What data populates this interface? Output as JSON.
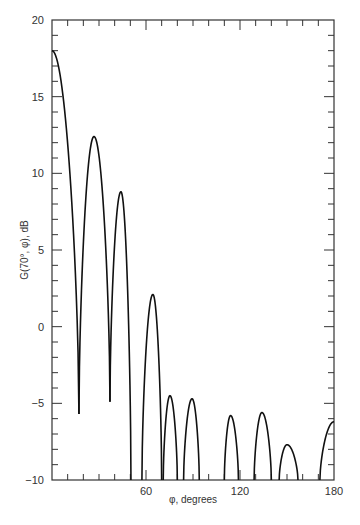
{
  "chart_data": {
    "type": "line",
    "title": "",
    "xlabel": "φ, degrees",
    "ylabel": "G(70°, φ), dB",
    "xlim": [
      0,
      180
    ],
    "ylim": [
      -10,
      20
    ],
    "grid": false,
    "legend": null,
    "x_major_ticks": [
      60,
      120,
      180
    ],
    "x_minor_step": 10,
    "y_major_ticks": [
      -10,
      -5,
      0,
      5,
      10,
      15,
      20
    ],
    "y_minor_step": 1,
    "x_tick_labels": [
      "60",
      "120",
      "180"
    ],
    "y_tick_labels": [
      "−10",
      "−5",
      "0",
      "5",
      "10",
      "15",
      "20"
    ],
    "series": [
      {
        "name": "G(70°, φ)",
        "lobes": [
          {
            "start": [
              0,
              18.0
            ],
            "peak": [
              0,
              18.0
            ],
            "end": [
              17.2,
              -5.7
            ]
          },
          {
            "start": [
              17.2,
              -5.7
            ],
            "peak": [
              26.8,
              12.4
            ],
            "end": [
              37.0,
              -4.9
            ]
          },
          {
            "start": [
              37.0,
              -4.9
            ],
            "peak": [
              44.0,
              8.8
            ],
            "end": [
              50.4,
              -10
            ]
          },
          {
            "start": [
              57.4,
              -10
            ],
            "peak": [
              64.4,
              2.1
            ],
            "end": [
              70.0,
              -10
            ]
          },
          {
            "start": [
              71.0,
              -10
            ],
            "peak": [
              75.3,
              -4.5
            ],
            "end": [
              80.0,
              -10
            ]
          },
          {
            "start": [
              84.0,
              -10
            ],
            "peak": [
              89.4,
              -4.7
            ],
            "end": [
              94.0,
              -10
            ]
          },
          {
            "start": [
              110.0,
              -10
            ],
            "peak": [
              114.0,
              -5.8
            ],
            "end": [
              119.0,
              -10
            ]
          },
          {
            "start": [
              129.0,
              -10
            ],
            "peak": [
              134.0,
              -5.6
            ],
            "end": [
              140.0,
              -10
            ]
          },
          {
            "start": [
              145.0,
              -10
            ],
            "peak": [
              150.0,
              -7.7
            ],
            "end": [
              157.0,
              -10
            ]
          },
          {
            "start": [
              171.0,
              -10
            ],
            "peak": [
              180.0,
              -6.2
            ],
            "end": [
              180.0,
              -6.2
            ]
          }
        ]
      }
    ]
  },
  "style": {
    "line_color": "#111111",
    "axis_color": "#333333"
  }
}
